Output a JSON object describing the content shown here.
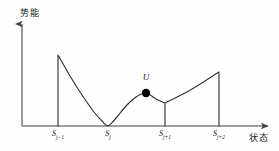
{
  "figure": {
    "title": "",
    "axes": {
      "ylabel": "势能",
      "xlabel": "状态"
    },
    "annotations": {
      "particle_label": "U"
    },
    "colors": {
      "curve": "#333333",
      "axis": "#444444",
      "marker": "#000000",
      "background": "#fefefe"
    }
  },
  "chart_data": {
    "type": "line",
    "title": "",
    "xlabel": "状态",
    "ylabel": "势能",
    "grid": false,
    "legend": null,
    "xlim": [
      0,
      4
    ],
    "ylim": [
      0,
      1
    ],
    "tick_labels": [
      {
        "text_main": "S",
        "text_sub": "j−1",
        "x_px": 58
      },
      {
        "text_main": "S",
        "text_sub": "j",
        "x_px": 108
      },
      {
        "text_main": "S",
        "text_sub": "j+1",
        "x_px": 165
      },
      {
        "text_main": "S",
        "text_sub": "j+2",
        "x_px": 219
      }
    ],
    "series": [
      {
        "name": "potential energy landscape",
        "points": [
          {
            "x_px": 58,
            "y_px": 126
          },
          {
            "x_px": 58,
            "y_px": 55
          },
          {
            "x_px": 70,
            "y_px": 76
          },
          {
            "x_px": 82,
            "y_px": 95
          },
          {
            "x_px": 94,
            "y_px": 112
          },
          {
            "x_px": 102,
            "y_px": 121
          },
          {
            "x_px": 108,
            "y_px": 126
          },
          {
            "x_px": 116,
            "y_px": 118
          },
          {
            "x_px": 126,
            "y_px": 106
          },
          {
            "x_px": 136,
            "y_px": 97
          },
          {
            "x_px": 146,
            "y_px": 93
          },
          {
            "x_px": 156,
            "y_px": 99
          },
          {
            "x_px": 165,
            "y_px": 103
          },
          {
            "x_px": 165,
            "y_px": 126
          },
          {
            "x_px": 165,
            "y_px": 103
          },
          {
            "x_px": 185,
            "y_px": 93
          },
          {
            "x_px": 205,
            "y_px": 81
          },
          {
            "x_px": 219,
            "y_px": 72
          },
          {
            "x_px": 219,
            "y_px": 126
          }
        ]
      }
    ],
    "markers": [
      {
        "label": "U",
        "x_px": 146,
        "y_px": 93,
        "radius": 4.2,
        "filled": true
      }
    ]
  }
}
